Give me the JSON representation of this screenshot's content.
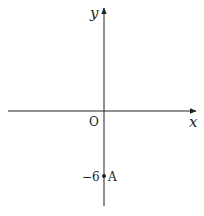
{
  "diagram": {
    "type": "coordinate-plane",
    "axes": {
      "x_label": "x",
      "y_label": "y",
      "origin_label": "O"
    },
    "points": [
      {
        "name": "A",
        "coordinate_label": "−6",
        "x": 0,
        "y": -6
      }
    ],
    "colors": {
      "line": "#222222",
      "background": "#ffffff"
    }
  }
}
